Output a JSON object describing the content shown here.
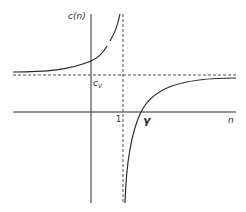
{
  "diagram": {
    "title": "",
    "type": "function-plot",
    "axes": {
      "y_label": "c(n)",
      "x_label": "n"
    },
    "labels": {
      "cv_main": "c",
      "cv_sub": "V",
      "one": "1",
      "gamma": "γ"
    },
    "asymptotes": {
      "vertical": {
        "at": "n = 1",
        "style": "dashed"
      },
      "horizontal": {
        "at": "c = c_V",
        "style": "dashed"
      }
    },
    "curve": {
      "description": "c(n) hyperbola with two branches; left branch rises to +∞ as n → 1⁻, right branch rises from −∞ at n → 1⁺, crosses zero at n = γ, and approaches c_V as n → ∞",
      "zero_crossing": "γ"
    },
    "colors": {
      "line": "#2a2a2a",
      "dashed": "#3a3a3a",
      "background": "#ffffff"
    }
  }
}
